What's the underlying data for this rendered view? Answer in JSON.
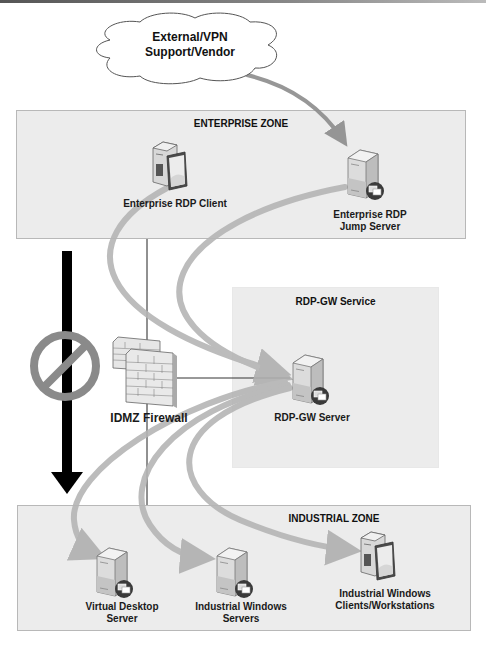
{
  "diagram": {
    "cloud": {
      "label_line1": "External/VPN",
      "label_line2": "Support/Vendor"
    },
    "zones": {
      "enterprise": {
        "title": "ENTERPRISE ZONE"
      },
      "rdp_gw": {
        "title": "RDP-GW Service"
      },
      "industrial": {
        "title": "INDUSTRIAL ZONE"
      }
    },
    "nodes": {
      "enterprise_rdp_client": {
        "label_line1": "Enterprise RDP Client",
        "icon": "workstation-icon"
      },
      "enterprise_jump_server": {
        "label_line1": "Enterprise RDP",
        "label_line2": "Jump Server",
        "icon": "rdp-server-icon"
      },
      "idmz_firewall": {
        "label_line1": "IDMZ Firewall",
        "icon": "firewall-icon"
      },
      "rdp_gw_server": {
        "label_line1": "RDP-GW Server",
        "icon": "rdp-server-icon"
      },
      "virtual_desktop_server": {
        "label_line1": "Virtual Desktop",
        "label_line2": "Server",
        "icon": "rdp-server-icon"
      },
      "industrial_windows_servers": {
        "label_line1": "Industrial Windows",
        "label_line2": "Servers",
        "icon": "rdp-server-icon"
      },
      "industrial_windows_clients": {
        "label_line1": "Industrial Windows",
        "label_line2": "Clients/Workstations",
        "icon": "workstation-icon"
      }
    },
    "flows": [
      {
        "from": "External/VPN Support/Vendor",
        "to": "Enterprise RDP Jump Server"
      },
      {
        "from": "Enterprise RDP Client",
        "to": "RDP-GW Server"
      },
      {
        "from": "Enterprise RDP Jump Server",
        "to": "RDP-GW Server"
      },
      {
        "from": "RDP-GW Server",
        "to": "Virtual Desktop Server"
      },
      {
        "from": "RDP-GW Server",
        "to": "Industrial Windows Servers"
      },
      {
        "from": "RDP-GW Server",
        "to": "Industrial Windows Clients/Workstations"
      }
    ],
    "blocked_direct_path": {
      "symbol": "no-entry-icon",
      "meaning": "Direct enterprise-to-industrial traffic prohibited"
    },
    "colors": {
      "zone_fill": "#ececec",
      "zone_border": "#b8b8b8",
      "flow_arrow": "#b5b5b5",
      "blocked_arrow": "#000000",
      "prohibition_sign": "#8a8a8a"
    }
  }
}
